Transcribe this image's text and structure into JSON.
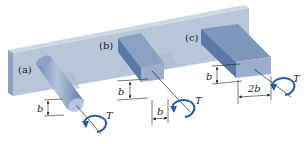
{
  "figure": {
    "colors": {
      "plate_front": "#b9c6da",
      "plate_top": "#cdd7e6",
      "plate_side": "#8ea2c2",
      "bar_top": "#7f97bd",
      "bar_side": "#5c78a6",
      "bar_end": "#9aaecd",
      "shadow": "#d5dbe5",
      "line": "#222222",
      "torque_arrow": "#2d5aa0"
    },
    "bars": [
      {
        "label": "(a)",
        "shape": "circular",
        "dimension_height": "b",
        "torque": "T"
      },
      {
        "label": "(b)",
        "shape": "square",
        "dimension_height": "b",
        "dimension_width": "b",
        "torque": "T"
      },
      {
        "label": "(c)",
        "shape": "rectangular",
        "dimension_height": "b",
        "dimension_width": "2b",
        "torque": "T"
      }
    ]
  }
}
